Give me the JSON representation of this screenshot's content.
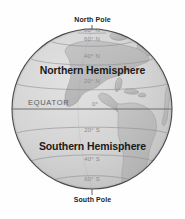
{
  "figure": {
    "type": "globe-hemispheres-diagram",
    "projection": "orthographic",
    "centered_on": "Americas",
    "background_color": "#fefefe",
    "globe_fill_color": "#d2d2d2",
    "globe_outline_color": "#4a4a4a",
    "land_color": "#bdbdbd",
    "gridline_color": "#8f8f8f",
    "equator_color": "#6e6e6e"
  },
  "annotations": {
    "north_pole": "North Pole",
    "south_pole": "South Pole",
    "northern_hemisphere": "Northern Hemisphere",
    "southern_hemisphere": "Southern Hemisphere",
    "equator": "EQUATOR"
  },
  "latitudes": [
    {
      "label": "80° N",
      "value": 80,
      "x": 92,
      "y": 30
    },
    {
      "label": "60° N",
      "value": 60,
      "x": 92,
      "y": 39
    },
    {
      "label": "40° N",
      "value": 40,
      "x": 92,
      "y": 56
    },
    {
      "label": "20° N",
      "value": 20,
      "x": 92,
      "y": 81
    },
    {
      "label": "0°",
      "value": 0,
      "x": 95,
      "y": 104
    },
    {
      "label": "20° S",
      "value": -20,
      "x": 92,
      "y": 130
    },
    {
      "label": "40° S",
      "value": -40,
      "x": 92,
      "y": 159
    },
    {
      "label": "60° S",
      "value": -60,
      "x": 92,
      "y": 179
    }
  ]
}
